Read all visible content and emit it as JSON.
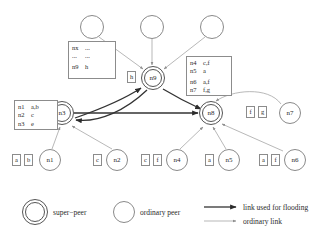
{
  "figure": {
    "type": "super-peer network topology diagram",
    "nodes": [
      {
        "id": "top-left-peer",
        "label": "",
        "kind": "ordinary peer",
        "x": 92,
        "y": 27,
        "r": 12
      },
      {
        "id": "top-mid-peer",
        "label": "",
        "kind": "ordinary peer",
        "x": 152,
        "y": 27,
        "r": 12
      },
      {
        "id": "top-right-peer",
        "label": "",
        "kind": "ordinary peer",
        "x": 212,
        "y": 27,
        "r": 12
      },
      {
        "id": "n9",
        "label": "n9",
        "kind": "super-peer",
        "x": 153,
        "y": 78,
        "r": 11
      },
      {
        "id": "n3",
        "label": "n3",
        "kind": "super-peer",
        "x": 62,
        "y": 113,
        "r": 11
      },
      {
        "id": "n8",
        "label": "n8",
        "kind": "super-peer",
        "x": 211,
        "y": 113,
        "r": 11
      },
      {
        "id": "n7",
        "label": "n7",
        "kind": "ordinary peer",
        "x": 290,
        "y": 113,
        "r": 11
      },
      {
        "id": "n1",
        "label": "n1",
        "kind": "ordinary peer",
        "x": 50,
        "y": 160,
        "r": 11
      },
      {
        "id": "n2",
        "label": "n2",
        "kind": "ordinary peer",
        "x": 117,
        "y": 160,
        "r": 11
      },
      {
        "id": "n4",
        "label": "n4",
        "kind": "ordinary peer",
        "x": 177,
        "y": 160,
        "r": 11
      },
      {
        "id": "n5",
        "label": "n5",
        "kind": "ordinary peer",
        "x": 229,
        "y": 160,
        "r": 11
      },
      {
        "id": "n6",
        "label": "n6",
        "kind": "ordinary peer",
        "x": 295,
        "y": 160,
        "r": 11
      }
    ],
    "key_labels": [
      {
        "id": "n9-key-h",
        "text": "h"
      },
      {
        "id": "n3-key-e",
        "text": "e"
      },
      {
        "id": "n8-key-f",
        "text": "f"
      },
      {
        "id": "n8-key-g",
        "text": "g"
      },
      {
        "id": "n1-key-a",
        "text": "a"
      },
      {
        "id": "n1-key-b",
        "text": "b"
      },
      {
        "id": "n2-key-c",
        "text": "c"
      },
      {
        "id": "n4-key-c",
        "text": "c"
      },
      {
        "id": "n4-key-f",
        "text": "f"
      },
      {
        "id": "n5-key-a",
        "text": "a"
      },
      {
        "id": "n6-key-a",
        "text": "a"
      },
      {
        "id": "n6-key-f",
        "text": "f"
      }
    ],
    "index_tables": [
      {
        "id": "n9-routing-index",
        "rows": [
          {
            "peer": "nx",
            "keys": "..."
          },
          {
            "peer": "...",
            "keys": "..."
          },
          {
            "peer": "n9",
            "keys": "h"
          }
        ],
        "gap_after": 1
      },
      {
        "id": "n3-routing-index",
        "rows": [
          {
            "peer": "n1",
            "keys": "a,b"
          },
          {
            "peer": "n2",
            "keys": "c"
          },
          {
            "peer": "n3",
            "keys": "e"
          }
        ],
        "gap_after": -1
      },
      {
        "id": "n8-routing-index",
        "rows": [
          {
            "peer": "n4",
            "keys": "c,f"
          },
          {
            "peer": "n5",
            "keys": "a"
          },
          {
            "peer": "n6",
            "keys": "a,f"
          },
          {
            "peer": "n7",
            "keys": "f,g"
          }
        ],
        "gap_after": 1
      }
    ]
  },
  "legend": {
    "items": [
      {
        "id": "legend-super-peer",
        "label": "super−peer",
        "glyph": "double-circle-icon"
      },
      {
        "id": "legend-ordinary-peer",
        "label": "ordinary peer",
        "glyph": "circle-icon"
      },
      {
        "id": "legend-flood-link",
        "label": "link used for flooding",
        "glyph": "thick-arrow-icon"
      },
      {
        "id": "legend-ordinary-link",
        "label": "ordinary link",
        "glyph": "thin-arrow-icon"
      }
    ]
  },
  "colors": {
    "thick_link": "#333333",
    "thin_link": "#9a9a9a",
    "node_stroke": "#8a8a8a",
    "superpeer_stroke": "#555555",
    "box_stroke": "#8c8c8c",
    "text": "#2a2a2a",
    "background": "#ffffff"
  }
}
